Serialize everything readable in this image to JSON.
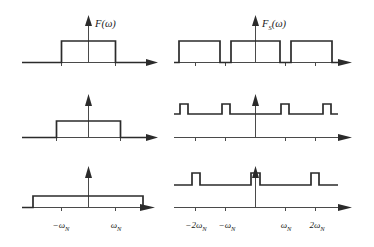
{
  "figure": {
    "colors": {
      "signal": "#2b2b2b",
      "axis": "#4a4a4a",
      "background": "#ffffff"
    },
    "columns": [
      {
        "id": "left",
        "axis_label": "F(ω)",
        "axis_label_main": "F",
        "axis_label_sub": "",
        "axis_label_arg": "(ω)"
      },
      {
        "id": "right",
        "axis_label": "F",
        "axis_label_main": "F",
        "axis_label_sub": "S",
        "axis_label_arg": "(ω)"
      }
    ],
    "tick_labels": {
      "left": [
        "−ω",
        "ω"
      ],
      "right": [
        "−2ω",
        "−ω",
        "ω",
        "2ω"
      ],
      "subscript": "N"
    },
    "left_tick_text": [
      "−ωN",
      "ωN"
    ],
    "right_tick_text": [
      "−2ωN",
      "−ωN",
      "ωN",
      "2ωN"
    ]
  },
  "chart_data": {
    "type": "line",
    "xlabel": "ω",
    "ylabel": "",
    "grid": false,
    "legend": "none",
    "panels": [
      {
        "row": 1,
        "column": "left",
        "name": "baseband-narrow",
        "axis_label": "F(ω)",
        "description": "Rectangular baseband spectrum, narrow bandwidth, tall amplitude",
        "x": [
          -3.2,
          -1.0,
          -1.0,
          1.0,
          1.0,
          3.2
        ],
        "y": [
          0,
          0,
          1.0,
          1.0,
          0,
          0
        ],
        "band_edges": [
          -1.0,
          1.0
        ],
        "amplitude": 1.0,
        "ticks": [
          -1.0,
          1.0
        ],
        "tick_labels": [
          "",
          ""
        ],
        "xlim": [
          -3.4,
          3.6
        ],
        "ylim": [
          0,
          1.35
        ],
        "has_vertical_axis": true
      },
      {
        "row": 1,
        "column": "right",
        "name": "sampled-narrow-low-rate",
        "axis_label": "F_S(ω)",
        "description": "Sampled spectrum: wide replicas nearly overlapping, sampling frequency close to 2ωN",
        "replica_centers": [
          -2.0,
          0.0,
          2.0
        ],
        "replica_halfwidth": 0.86,
        "amplitude": 1.0,
        "x": [
          -3.4,
          -2.86,
          -2.86,
          -1.14,
          -1.14,
          -0.86,
          -0.86,
          0.86,
          0.86,
          1.14,
          1.14,
          2.86,
          2.86,
          3.4
        ],
        "y": [
          0,
          0,
          1.0,
          1.0,
          0,
          0,
          1.0,
          1.0,
          0,
          0,
          1.0,
          1.0,
          0,
          0
        ],
        "ticks": [
          -2.0,
          -1.0,
          1.0,
          2.0
        ],
        "tick_labels": [
          "",
          "",
          "",
          ""
        ],
        "xlim": [
          -3.5,
          3.8
        ],
        "ylim": [
          0,
          1.35
        ],
        "has_vertical_axis": true
      },
      {
        "row": 2,
        "column": "left",
        "name": "baseband-medium",
        "axis_label": "",
        "description": "Rectangular baseband spectrum, wider bandwidth, medium amplitude",
        "x": [
          -3.2,
          -1.35,
          -1.35,
          1.35,
          1.35,
          3.2
        ],
        "y": [
          0,
          0,
          0.72,
          0.72,
          0,
          0
        ],
        "band_edges": [
          -1.35,
          1.35
        ],
        "amplitude": 0.72,
        "ticks": [
          -1.35,
          1.35
        ],
        "tick_labels": [
          "",
          ""
        ],
        "xlim": [
          -3.4,
          3.6
        ],
        "ylim": [
          0,
          1.35
        ],
        "has_vertical_axis": true
      },
      {
        "row": 2,
        "column": "right",
        "name": "sampled-medium-rate",
        "axis_label": "",
        "description": "Sampled spectrum: flat plateau with four narrow tall bumps at replica edges",
        "plateau_level": 0.42,
        "bump_level": 0.72,
        "bump_centers": [
          -2.9,
          -1.35,
          1.35,
          2.9
        ],
        "bump_halfwidth": 0.2,
        "x": [
          -3.4,
          -3.1,
          -3.1,
          -2.7,
          -2.7,
          -1.55,
          -1.55,
          -1.15,
          -1.15,
          1.15,
          1.15,
          1.55,
          1.55,
          2.7,
          2.7,
          3.1,
          3.1,
          3.4
        ],
        "y": [
          0.42,
          0.42,
          0.72,
          0.72,
          0.42,
          0.42,
          0.72,
          0.72,
          0.42,
          0.42,
          0.72,
          0.72,
          0.42,
          0.42,
          0.72,
          0.72,
          0.42,
          0.42
        ],
        "ticks": [
          -2.0,
          -1.0,
          1.0,
          2.0
        ],
        "tick_labels": [
          "",
          "",
          "",
          ""
        ],
        "xlim": [
          -3.5,
          3.8
        ],
        "ylim": [
          0,
          1.35
        ],
        "has_vertical_axis": true
      },
      {
        "row": 3,
        "column": "left",
        "name": "baseband-wide",
        "axis_label": "",
        "description": "Rectangular baseband spectrum, widest bandwidth, lowest amplitude",
        "x": [
          -3.2,
          -2.3,
          -2.3,
          2.3,
          2.3,
          3.2
        ],
        "y": [
          0,
          0,
          0.42,
          0.42,
          0,
          0
        ],
        "band_edges": [
          -2.3,
          2.3
        ],
        "amplitude": 0.42,
        "ticks": [
          -1.0,
          1.0
        ],
        "tick_labels": [
          "−ωN",
          "ωN"
        ],
        "xlim": [
          -3.4,
          3.6
        ],
        "ylim": [
          0,
          1.35
        ],
        "has_vertical_axis": true
      },
      {
        "row": 3,
        "column": "right",
        "name": "sampled-high-rate",
        "axis_label": "",
        "description": "Sampled spectrum: low flat plateau with three narrow peaks at 0 and ±2ωN, well separated replicas",
        "plateau_level": 0.22,
        "peak_level": 0.6,
        "peak_centers": [
          -2.0,
          0.0,
          2.0
        ],
        "peak_halfwidth": 0.2,
        "x": [
          -3.4,
          -2.2,
          -2.2,
          -1.8,
          -1.8,
          -0.2,
          -0.2,
          0.2,
          0.2,
          1.8,
          1.8,
          2.2,
          2.2,
          3.4
        ],
        "y": [
          0.22,
          0.22,
          0.6,
          0.6,
          0.22,
          0.22,
          0.6,
          0.6,
          0.22,
          0.22,
          0.6,
          0.6,
          0.22,
          0.22
        ],
        "ticks": [
          -2.0,
          -1.0,
          1.0,
          2.0
        ],
        "tick_labels": [
          "−2ωN",
          "−ωN",
          "ωN",
          "2ωN"
        ],
        "xlim": [
          -3.5,
          3.8
        ],
        "ylim": [
          0,
          1.35
        ],
        "has_vertical_axis": true
      }
    ]
  }
}
